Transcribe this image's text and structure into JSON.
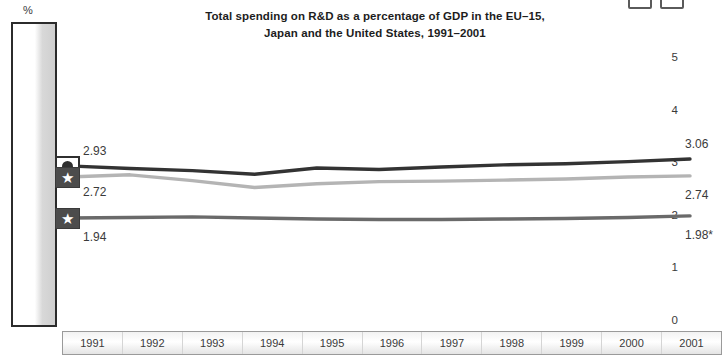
{
  "window_controls": [
    {
      "name": "restore-button",
      "label": ""
    },
    {
      "name": "close-button",
      "label": ""
    }
  ],
  "axis": {
    "unit_label": "%",
    "y_ticks": [
      "5",
      "4",
      "3",
      "2",
      "1",
      "0"
    ]
  },
  "series_markers": [
    {
      "icon": "circle-marker-icon",
      "glyph": "●",
      "style": "light"
    },
    {
      "icon": "star-marker-icon",
      "glyph": "★",
      "style": "dark"
    },
    {
      "icon": "star-marker-icon",
      "glyph": "★",
      "style": "dark"
    }
  ],
  "labels": {
    "start_japan": "2.93",
    "start_us": "2.72",
    "start_eu": "1.94",
    "end_japan": "3.06",
    "end_us": "2.74",
    "end_eu": "1.98*"
  },
  "chart_data": {
    "type": "line",
    "title_line1": "Total spending on R&D as a percentage of GDP in the EU–15,",
    "title_line2": "Japan and the United States, 1991–2001",
    "xlabel": "",
    "ylabel": "%",
    "ylim": [
      0,
      5.5
    ],
    "yticks": [
      0,
      1,
      2,
      3,
      4,
      5
    ],
    "grid": false,
    "legend": "none",
    "categories": [
      "1991",
      "1992",
      "1993",
      "1994",
      "1995",
      "1996",
      "1997",
      "1998",
      "1999",
      "2000",
      "2001"
    ],
    "series": [
      {
        "name": "Japan",
        "color": "#333333",
        "marker": "circle",
        "start_label": "2.93",
        "end_label": "3.06",
        "values": [
          2.93,
          2.88,
          2.84,
          2.77,
          2.89,
          2.86,
          2.91,
          2.95,
          2.97,
          3.01,
          3.06
        ]
      },
      {
        "name": "United States",
        "color": "#b4b4b4",
        "marker": "star",
        "start_label": "2.72",
        "end_label": "2.74",
        "values": [
          2.72,
          2.76,
          2.65,
          2.52,
          2.59,
          2.63,
          2.64,
          2.66,
          2.68,
          2.72,
          2.74
        ]
      },
      {
        "name": "EU-15",
        "color": "#6a6a6a",
        "marker": "star",
        "start_label": "1.94",
        "end_label": "1.98*",
        "values": [
          1.94,
          1.95,
          1.96,
          1.94,
          1.92,
          1.91,
          1.91,
          1.92,
          1.93,
          1.95,
          1.98
        ]
      }
    ]
  }
}
